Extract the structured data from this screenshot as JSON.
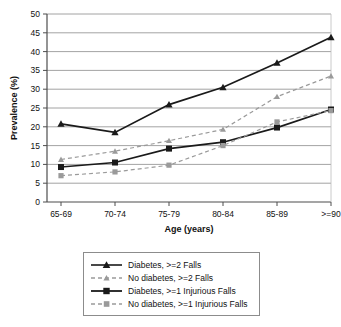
{
  "chart_data": {
    "type": "line",
    "title": "",
    "xlabel": "Age (years)",
    "ylabel": "Prevalence (%)",
    "categories": [
      "65-69",
      "70-74",
      "75-79",
      "80-84",
      "85-89",
      ">=90"
    ],
    "ylim": [
      0,
      50
    ],
    "yticks": [
      0,
      5,
      10,
      15,
      20,
      25,
      30,
      35,
      40,
      45,
      50
    ],
    "ytick_labels": [
      "0",
      "5",
      "10",
      "15",
      "20",
      "25",
      "30",
      "35",
      "40",
      "45",
      "50"
    ],
    "grid": "horizontal",
    "legend_position": "below",
    "series": [
      {
        "name": "Diabetes, >=2 Falls",
        "values": [
          20.8,
          18.5,
          25.9,
          30.5,
          37.0,
          43.8
        ],
        "color": "#1a1a1a",
        "marker": "triangle",
        "line_style": "solid"
      },
      {
        "name": "No diabetes, >=2 Falls",
        "values": [
          11.3,
          13.5,
          16.3,
          19.3,
          28.0,
          33.5
        ],
        "color": "#9a9a9a",
        "marker": "triangle",
        "line_style": "dashed"
      },
      {
        "name": "Diabetes, >=1 Injurious Falls",
        "values": [
          9.3,
          10.5,
          14.2,
          15.9,
          19.8,
          24.6
        ],
        "color": "#1a1a1a",
        "marker": "square",
        "line_style": "solid"
      },
      {
        "name": "No diabetes, >=1 Injurious Falls",
        "values": [
          7.0,
          8.0,
          9.8,
          15.0,
          21.3,
          24.3
        ],
        "color": "#9a9a9a",
        "marker": "square",
        "line_style": "dashed"
      }
    ]
  },
  "legend": {
    "items": [
      {
        "label": "Diabetes, >=2 Falls"
      },
      {
        "label": "No diabetes, >=2 Falls"
      },
      {
        "label": "Diabetes, >=1 Injurious Falls"
      },
      {
        "label": "No diabetes, >=1 Injurious Falls"
      }
    ]
  }
}
